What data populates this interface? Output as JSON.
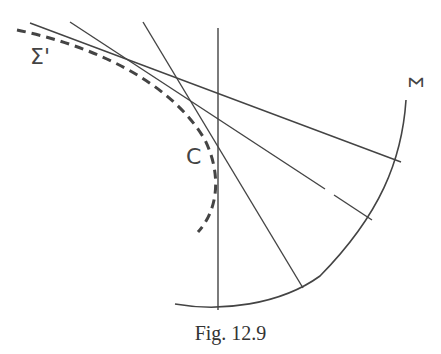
{
  "figure": {
    "caption": "Fig. 12.9",
    "labels": {
      "sigma_prime": "Σ'",
      "sigma": "Σ",
      "c": "C"
    },
    "colors": {
      "stroke": "#444444",
      "background": "#ffffff"
    }
  }
}
